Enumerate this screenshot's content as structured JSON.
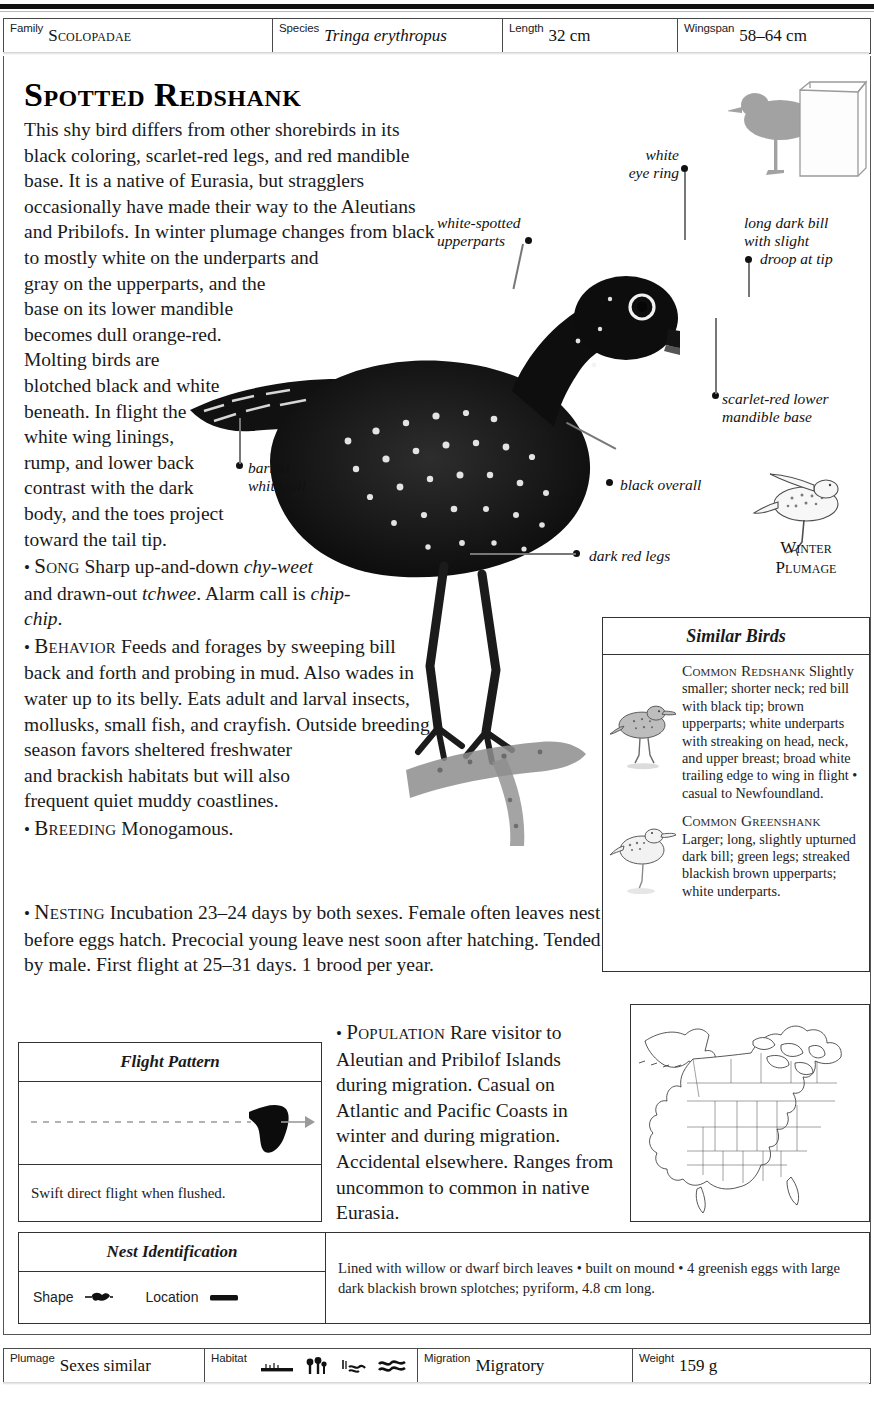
{
  "header": {
    "fields": [
      {
        "label": "Family",
        "value": "Scolopadae",
        "style": "smallcaps",
        "width": 268
      },
      {
        "label": "Species",
        "value": "Tringa erythropus",
        "style": "italic",
        "width": 230
      },
      {
        "label": "Length",
        "value": "32 cm",
        "style": "plain",
        "width": 175
      },
      {
        "label": "Wingspan",
        "value": "58–64 cm",
        "style": "plain",
        "width": 191
      }
    ]
  },
  "title": "Spotted Redshank",
  "description": {
    "intro": "This shy bird differs from other shorebirds in its black coloring, scarlet-red legs, and red mandible base. It is a native of Eurasia, but stragglers occasionally have made their way to the Aleutians and Pribilofs. In winter plumage changes from black to mostly white on the underparts and gray on the upperparts, and the base on its lower mandible becomes dull orange-red. Molting birds are blotched black and white beneath. In flight the white wing linings, rump, and lower back contrast with the dark body, and the toes project toward the tail tip.",
    "sections": [
      {
        "name": "Song",
        "text": "Sharp up-and-down chy-weet and drawn-out tchwee. Alarm call is chip-chip."
      },
      {
        "name": "Behavior",
        "text": "Feeds and forages by sweeping bill back and forth and probing in mud. Also wades in water up to its belly. Eats adult and larval insects, mollusks, small fish, and crayfish. Outside breeding season favors sheltered freshwater and brackish habitats but will also frequent quiet muddy coastlines."
      },
      {
        "name": "Breeding",
        "text": "Monogamous."
      },
      {
        "name": "Nesting",
        "text": "Incubation 23–24 days by both sexes. Female often leaves nest before eggs hatch. Precocial young leave nest soon after hatching. Tended by male. First flight at 25–31 days. 1 brood per year."
      },
      {
        "name": "Population",
        "text": "Rare visitor to Aleutian and Pribilof Islands during migration. Casual on Atlantic and Pacific Coasts in winter and during migration. Accidental elsewhere. Ranges from uncommon to common in native Eurasia."
      }
    ],
    "song_italics": [
      "chy-weet",
      "tchwee",
      "chip-chip"
    ]
  },
  "callouts": [
    {
      "id": "white-eye-ring",
      "lines": [
        "white",
        "eye ring"
      ]
    },
    {
      "id": "white-spotted-upperparts",
      "lines": [
        "white-spotted",
        "upperparts"
      ]
    },
    {
      "id": "long-dark-bill",
      "lines": [
        "long dark bill",
        "with slight",
        "droop at tip"
      ]
    },
    {
      "id": "scarlet-red-mandible",
      "lines": [
        "scarlet-red lower",
        "mandible base"
      ]
    },
    {
      "id": "barred-white-tail",
      "lines": [
        "barred",
        "white tail"
      ]
    },
    {
      "id": "black-overall",
      "lines": [
        "black overall"
      ]
    },
    {
      "id": "dark-red-legs",
      "lines": [
        "dark red legs"
      ]
    }
  ],
  "winter_plumage_label": [
    "Winter",
    "Plumage"
  ],
  "similar_birds": {
    "title": "Similar Birds",
    "entries": [
      {
        "name": "Common Redshank",
        "text": "Slightly smaller; shorter neck; red bill with black tip; brown upperparts; white underparts with streaking on head, neck, and upper breast; broad white trailing edge to wing in flight • casual to Newfoundland."
      },
      {
        "name": "Common Greenshank",
        "text": "Larger; long, slightly upturned dark bill; green legs; streaked blackish brown upperparts; white underparts."
      }
    ]
  },
  "flight_pattern": {
    "title": "Flight Pattern",
    "caption": "Swift direct flight when flushed."
  },
  "nest_identification": {
    "title": "Nest Identification",
    "shape_label": "Shape",
    "location_label": "Location",
    "text": "Lined with willow or dwarf birch leaves • built on mound • 4 greenish eggs with large dark blackish brown splotches; pyriform, 4.8 cm long."
  },
  "bottom": {
    "fields": [
      {
        "label": "Plumage",
        "value": "Sexes similar",
        "width": 200
      },
      {
        "label": "Habitat",
        "value": "",
        "width": 213,
        "icons": [
          "shoreline-icon",
          "marsh-grass-icon",
          "water-reeds-icon",
          "waves-icon"
        ]
      },
      {
        "label": "Migration",
        "value": "Migratory",
        "width": 215
      },
      {
        "label": "Weight",
        "value": "159 g",
        "width": 236
      }
    ]
  },
  "colors": {
    "ink": "#1a1a1a",
    "rule": "#333333",
    "lead_line": "#777777",
    "silhouette": "#9a9a9a"
  }
}
